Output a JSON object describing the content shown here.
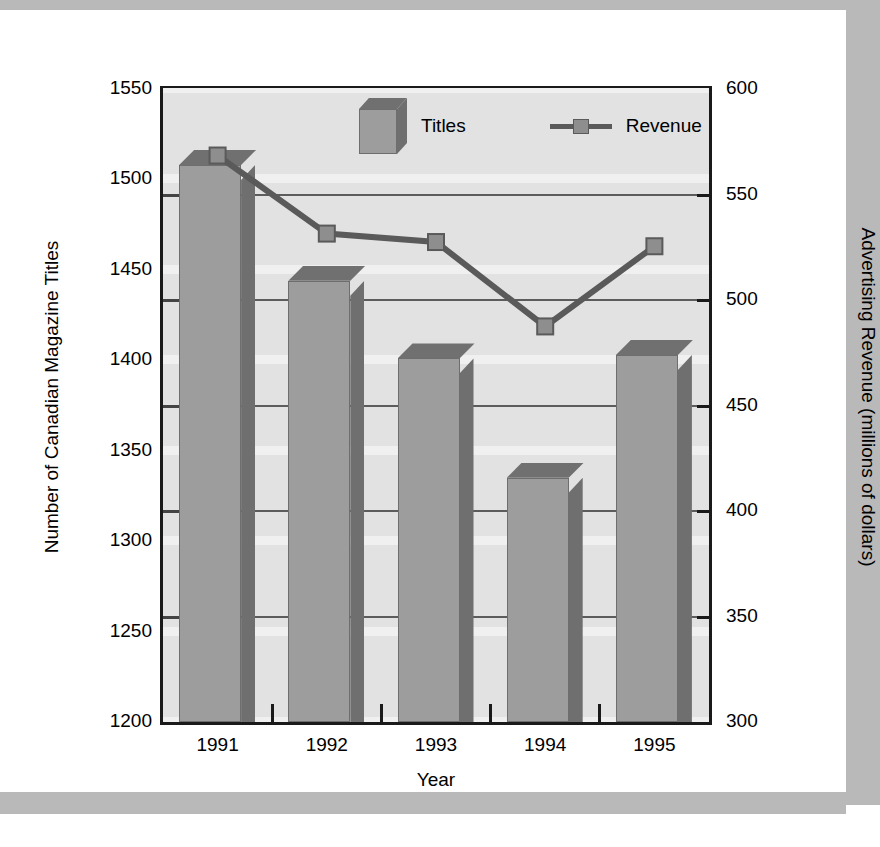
{
  "chart_data": {
    "type": "bar",
    "title": "",
    "xlabel": "Year",
    "categories": [
      "1991",
      "1992",
      "1993",
      "1994",
      "1995"
    ],
    "grid": true,
    "legend_position": "top-center",
    "axes": {
      "left": {
        "label": "Number of Canadian Magazine Titles",
        "ticks": [
          1550,
          1500,
          1450,
          1400,
          1350,
          1300,
          1250,
          1200
        ],
        "ylim": [
          1200,
          1550
        ]
      },
      "right": {
        "label": "Advertising Revenue (millions of dollars)",
        "ticks": [
          600,
          550,
          500,
          450,
          400,
          350,
          300
        ],
        "ylim": [
          300,
          600
        ]
      }
    },
    "series": [
      {
        "name": "Titles",
        "type": "bar",
        "axis": "left",
        "color": "#9d9d9d",
        "values": [
          1508,
          1444,
          1401,
          1335,
          1403
        ]
      },
      {
        "name": "Revenue",
        "type": "line",
        "axis": "right",
        "color": "#5a5a5a",
        "values": [
          568,
          531,
          527,
          487,
          525
        ]
      }
    ]
  },
  "legend": {
    "entries": [
      {
        "label": "Titles",
        "icon": "cube-swatch"
      },
      {
        "label": "Revenue",
        "icon": "line-marker-swatch"
      }
    ]
  },
  "axis_titles": {
    "x": "Year",
    "y_left": "Number of Canadian Magazine Titles",
    "y_right": "Advertising Revenue (millions of dollars)"
  },
  "left_tick_labels": [
    "1550",
    "1500",
    "1450",
    "1400",
    "1350",
    "1300",
    "1250",
    "1200"
  ],
  "right_tick_labels": [
    "600",
    "550",
    "500",
    "450",
    "400",
    "350",
    "300"
  ],
  "x_tick_labels": [
    "1991",
    "1992",
    "1993",
    "1994",
    "1995"
  ]
}
